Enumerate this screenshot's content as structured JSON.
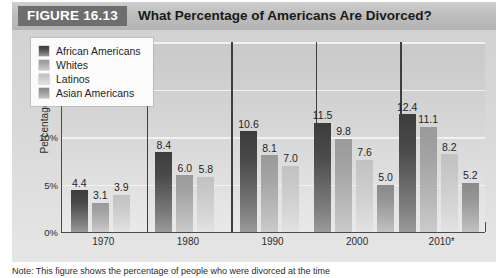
{
  "header": {
    "figure_tag": "FIGURE 16.13",
    "title": "What Percentage of Americans Are Divorced?"
  },
  "footnote": {
    "text": "Note: This figure shows the percentage of people who were divorced at the time"
  },
  "chart_data": {
    "type": "bar",
    "title": "What Percentage of Americans Are Divorced?",
    "xlabel": "",
    "ylabel": "Percentage",
    "categories": [
      "1970",
      "1980",
      "1990",
      "2000",
      "2010*"
    ],
    "ylim": [
      0,
      20
    ],
    "y_ticks": [
      {
        "value": 0,
        "label": "0%"
      },
      {
        "value": 5,
        "label": "5%"
      },
      {
        "value": 10,
        "label": "10%"
      },
      {
        "value": 15,
        "label": "15%"
      },
      {
        "value": 20,
        "label": "20%"
      }
    ],
    "grid": true,
    "grid_axis": "y",
    "legend_position": "top-left",
    "series": [
      {
        "name": "African Americans",
        "color": "#4a4a4a",
        "values": [
          4.4,
          8.4,
          10.6,
          11.5,
          12.4
        ],
        "labels": [
          "4.4",
          "8.4",
          "10.6",
          "11.5",
          "12.4"
        ]
      },
      {
        "name": "Whites",
        "color": "#a3a3a3",
        "values": [
          3.1,
          6.0,
          8.1,
          9.8,
          11.1
        ],
        "labels": [
          "3.1",
          "6.0",
          "8.1",
          "9.8",
          "11.1"
        ]
      },
      {
        "name": "Latinos",
        "color": "#c9c9c9",
        "values": [
          3.9,
          5.8,
          7.0,
          7.6,
          8.2
        ],
        "labels": [
          "3.9",
          "5.8",
          "7.0",
          "7.6",
          "8.2"
        ]
      },
      {
        "name": "Asian Americans",
        "color": "#949494",
        "values": [
          null,
          null,
          null,
          5.0,
          5.2
        ],
        "labels": [
          "",
          "",
          "",
          "5.0",
          "5.2"
        ]
      }
    ]
  }
}
